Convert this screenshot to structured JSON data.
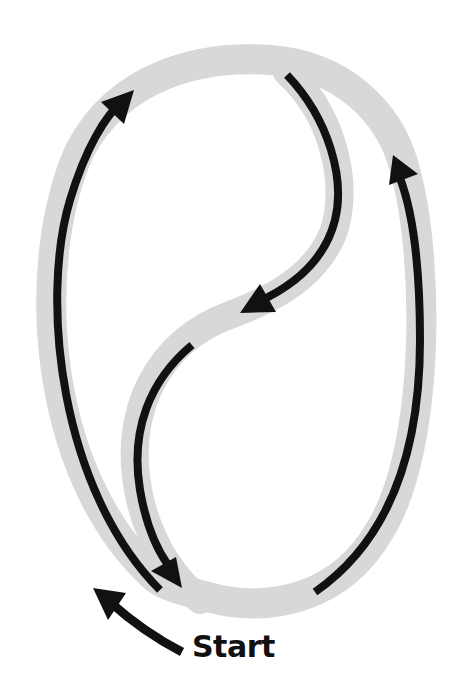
{
  "diagram": {
    "start_label": "Start",
    "colors": {
      "background": "#ffffff",
      "track": "#d8d8d8",
      "arrow": "#111111"
    },
    "track": {
      "outer_loop": "M 152 575 C 40 470, 30 260, 80 150 C 120 75, 200 55, 270 60 C 340 65, 390 110, 405 170 C 430 260, 430 450, 380 530 C 340 600, 270 610, 220 600 C 180 590, 160 585, 152 575",
      "s_curve": "M 287 72 C 340 120, 350 200, 330 240 C 310 280, 270 300, 230 315 C 160 340, 120 410, 140 500 C 150 540, 170 575, 200 600",
      "stroke_width": 30
    },
    "arrows": [
      {
        "id": "left-arc",
        "path": "M 160 590 C 60 490, 40 300, 70 200 C 85 150, 105 115, 124 100",
        "tip": [
          134,
          90
        ],
        "direction": "up"
      },
      {
        "id": "s-upper",
        "path": "M 287 75 C 330 120, 345 180, 335 220 C 325 260, 295 285, 258 302",
        "tip": [
          240,
          313
        ],
        "direction": "down-left"
      },
      {
        "id": "s-lower",
        "path": "M 192 345 C 150 380, 130 430, 140 490 C 146 525, 156 548, 168 565",
        "tip": [
          182,
          588
        ],
        "direction": "down"
      },
      {
        "id": "right-arc",
        "path": "M 315 592 C 390 540, 420 450, 420 340 C 420 260, 412 210, 400 178",
        "tip": [
          393,
          155
        ],
        "direction": "up"
      },
      {
        "id": "start-arrow",
        "path": "M 182 652 C 155 638, 130 620, 110 602",
        "tip": [
          93,
          588
        ],
        "direction": "up-left"
      }
    ]
  }
}
